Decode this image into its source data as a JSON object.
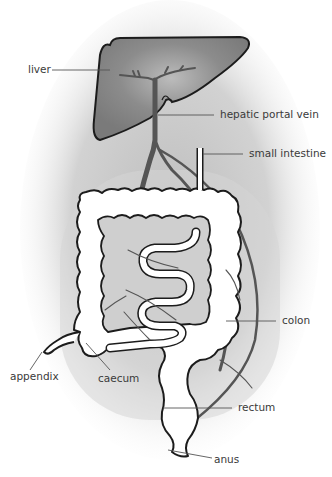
{
  "figure": {
    "labels": {
      "liver": "liver",
      "hepatic_portal_vein": "hepatic portal vein",
      "small_intestine": "small intestine",
      "colon": "colon",
      "appendix": "appendix",
      "caecum": "caecum",
      "rectum": "rectum",
      "anus": "anus"
    },
    "colors": {
      "background_shadow": "#d4d4d4",
      "liver_fill": "#8a8a8a",
      "vessel": "#5a5a5a",
      "outline": "#1c1c1c",
      "label_text": "#3a3a3a"
    }
  }
}
